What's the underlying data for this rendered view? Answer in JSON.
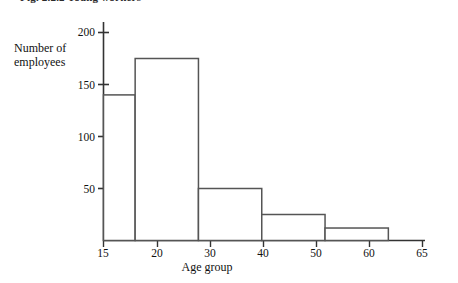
{
  "caption": "Fig. 2.2.2  Young workers",
  "chart_data": {
    "type": "bar",
    "title": "",
    "subtitle": "",
    "xlabel": "Age group",
    "ylabel": "Number of employees",
    "grid": false,
    "legend": "none",
    "xlim": [
      15,
      65
    ],
    "ylim": [
      0,
      210
    ],
    "x_ticks": [
      15,
      20,
      30,
      40,
      50,
      60,
      65
    ],
    "x_tick_labels": [
      "15",
      "20",
      "30",
      "40",
      "50",
      "60",
      "65"
    ],
    "y_ticks": [
      50,
      100,
      150,
      200
    ],
    "y_tick_labels": [
      "50",
      "100",
      "150",
      "200"
    ],
    "bin_edges": [
      15,
      20,
      30,
      40,
      50,
      60
    ],
    "categories": [
      "15-20",
      "20-30",
      "30-40",
      "40-50",
      "50-60"
    ],
    "values": [
      140,
      175,
      50,
      25,
      12
    ],
    "bar_fill": "#ffffff",
    "bar_stroke": "#555555",
    "axis_color": "#333333"
  }
}
